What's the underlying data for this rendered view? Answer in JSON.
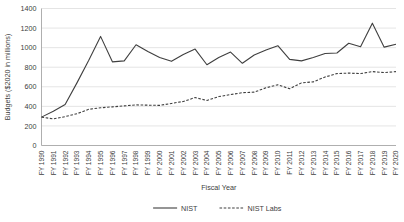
{
  "chart_data": {
    "type": "line",
    "title": "",
    "xlabel": "Fiscal Year",
    "ylabel": "Budgets ($2020 in millions)",
    "ylim": [
      0,
      1400
    ],
    "ytick_step": 200,
    "yticks": [
      0,
      200,
      400,
      600,
      800,
      1000,
      1200,
      1400
    ],
    "grid": true,
    "legend_position": "bottom",
    "categories": [
      "FY 1990",
      "FY 1991",
      "FY 1992",
      "FY 1993",
      "FY 1994",
      "FY 1995",
      "FY 1996",
      "FY 1997",
      "FY 1998",
      "FY 1999",
      "FY 2000",
      "FY 2001",
      "FY 2002",
      "FY 2003",
      "FY 2004",
      "FY 2005",
      "FY 2006",
      "FY 2007",
      "FY 2008",
      "FY 2009",
      "FY 2010",
      "FY 2011",
      "FY 2012",
      "FY 2013",
      "FY 2014",
      "FY 2015",
      "FY 2016",
      "FY 2017",
      "FY 2018",
      "FY 2019",
      "FY 2020"
    ],
    "series": [
      {
        "name": "NIST",
        "style": "solid",
        "color": "#3f3f3f",
        "values": [
          290,
          350,
          420,
          640,
          870,
          1115,
          855,
          865,
          1030,
          960,
          900,
          860,
          930,
          985,
          825,
          900,
          955,
          840,
          925,
          975,
          1020,
          880,
          865,
          900,
          940,
          945,
          1045,
          1010,
          1250,
          1005,
          1035
        ]
      },
      {
        "name": "NIST Labs",
        "style": "dashed",
        "color": "#3f3f3f",
        "values": [
          290,
          272,
          295,
          325,
          370,
          385,
          395,
          405,
          415,
          412,
          410,
          430,
          450,
          490,
          460,
          500,
          520,
          540,
          545,
          590,
          620,
          580,
          640,
          650,
          700,
          735,
          740,
          735,
          755,
          745,
          755
        ]
      }
    ]
  },
  "legend": {
    "items": [
      {
        "label": "NIST",
        "style": "solid"
      },
      {
        "label": "NIST Labs",
        "style": "dashed"
      }
    ]
  }
}
